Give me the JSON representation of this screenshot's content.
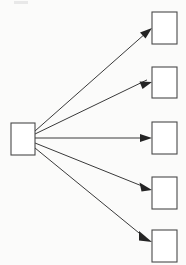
{
  "canvas": {
    "width": 186,
    "height": 265,
    "background_color": "#fbfbfa",
    "node_fill_color": "#ffffff",
    "node_stroke_color": "#4a4a4a",
    "edge_color": "#3a3a3a",
    "arrowhead_color": "#242424"
  },
  "diagram": {
    "type": "fan-out",
    "title": "",
    "source": {
      "label": "",
      "x": 11,
      "y": 123,
      "width": 24,
      "height": 32
    },
    "targets": [
      {
        "label": "",
        "x": 152,
        "y": 12,
        "width": 25,
        "height": 32
      },
      {
        "label": "",
        "x": 152,
        "y": 67,
        "width": 25,
        "height": 31
      },
      {
        "label": "",
        "x": 152,
        "y": 122,
        "width": 25,
        "height": 32
      },
      {
        "label": "",
        "x": 152,
        "y": 177,
        "width": 25,
        "height": 32
      },
      {
        "label": "",
        "x": 152,
        "y": 230,
        "width": 25,
        "height": 32
      }
    ],
    "edges": [
      {
        "label": "",
        "x1": 35,
        "y1": 131,
        "x2": 152,
        "y2": 28
      },
      {
        "label": "",
        "x1": 35,
        "y1": 134,
        "x2": 152,
        "y2": 82
      },
      {
        "label": "",
        "x1": 35,
        "y1": 138,
        "x2": 152,
        "y2": 138
      },
      {
        "label": "",
        "x1": 35,
        "y1": 143,
        "x2": 152,
        "y2": 190
      },
      {
        "label": "",
        "x1": 35,
        "y1": 148,
        "x2": 152,
        "y2": 242
      }
    ]
  }
}
